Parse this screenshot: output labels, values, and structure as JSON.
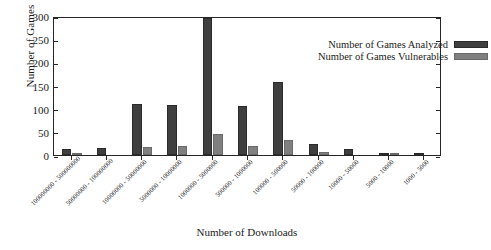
{
  "chart_data": {
    "type": "bar",
    "title": "",
    "xlabel": "Number of Downloads",
    "ylabel": "Number of Games",
    "ylim": [
      0,
      300
    ],
    "yticks": [
      0,
      50,
      100,
      150,
      200,
      250,
      300
    ],
    "grid": false,
    "legend_position": "top-right",
    "categories": [
      "100000000 - 500000000",
      "50000000 - 100000000",
      "10000000 - 50000000",
      "5000000 - 10000000",
      "1000000 - 5000000",
      "500000 - 1000000",
      "100000 - 500000",
      "50000 - 100000",
      "10000 - 50000",
      "5000 - 10000",
      "1000 - 5000"
    ],
    "series": [
      {
        "name": "Number of Games Analyzed",
        "color": "#3f3f3f",
        "values": [
          14,
          16,
          110,
          109,
          296,
          106,
          157,
          23,
          12,
          4,
          2
        ]
      },
      {
        "name": "Number of Games Vulnerables",
        "color": "#808080",
        "values": [
          2,
          0,
          17,
          19,
          46,
          20,
          33,
          7,
          0,
          1,
          0
        ]
      }
    ]
  }
}
